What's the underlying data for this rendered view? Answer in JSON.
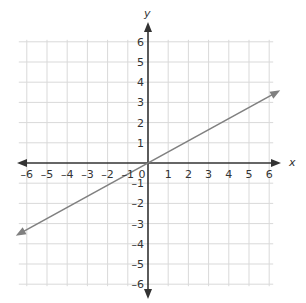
{
  "chart_data": {
    "type": "line",
    "title": "",
    "xlabel": "x",
    "ylabel": "y",
    "xlim": [
      -6,
      6
    ],
    "ylim": [
      -6,
      6
    ],
    "grid": true,
    "x_ticks": [
      "-6",
      "-5",
      "-4",
      "-3",
      "-2",
      "-1",
      "0",
      "1",
      "2",
      "3",
      "4",
      "5",
      "6"
    ],
    "y_ticks": [
      "6",
      "5",
      "4",
      "3",
      "2",
      "1",
      "-1",
      "-2",
      "-3",
      "-4",
      "-5",
      "-6"
    ],
    "series": [
      {
        "name": "line",
        "equation": "y = 0.55x",
        "x": [
          -6,
          0,
          6
        ],
        "y": [
          -3.3,
          0,
          3.3
        ],
        "arrows_both_ends": true
      }
    ]
  },
  "colors": {
    "axis": "#333333",
    "grid": "#d9d9d9",
    "line": "#808080",
    "text": "#333333"
  }
}
